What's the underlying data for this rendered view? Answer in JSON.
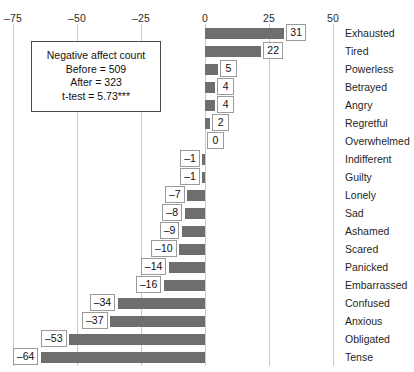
{
  "chart_data": {
    "type": "bar",
    "orientation": "horizontal",
    "title": "",
    "xlabel": "",
    "ylabel": "",
    "xlim": [
      -75,
      50
    ],
    "xticks": [
      -75,
      -50,
      -25,
      0,
      25,
      50
    ],
    "xtick_labels": [
      "–75",
      "–50",
      "–25",
      "0",
      "25",
      "50"
    ],
    "grid": true,
    "legend": "none",
    "bar_color": "#6e6e6e",
    "categories": [
      "Exhausted",
      "Tired",
      "Powerless",
      "Betrayed",
      "Angry",
      "Regretful",
      "Overwhelmed",
      "Indifferent",
      "Guilty",
      "Lonely",
      "Sad",
      "Ashamed",
      "Scared",
      "Panicked",
      "Embarrassed",
      "Confused",
      "Anxious",
      "Obligated",
      "Tense"
    ],
    "values": [
      31,
      22,
      5,
      4,
      4,
      2,
      0,
      -1,
      -1,
      -7,
      -8,
      -9,
      -10,
      -14,
      -16,
      -34,
      -37,
      -53,
      -64
    ],
    "data_labels": [
      "31",
      "22",
      "5",
      "4",
      "4",
      "2",
      "0",
      "–1",
      "–1",
      "–7",
      "–8",
      "–9",
      "–10",
      "–14",
      "–16",
      "–34",
      "–37",
      "–53",
      "–64"
    ]
  },
  "annotation": {
    "line1": "Negative affect count",
    "line2": "Before = 509",
    "line3": "After = 323",
    "line4": "t-test = 5.73***"
  }
}
